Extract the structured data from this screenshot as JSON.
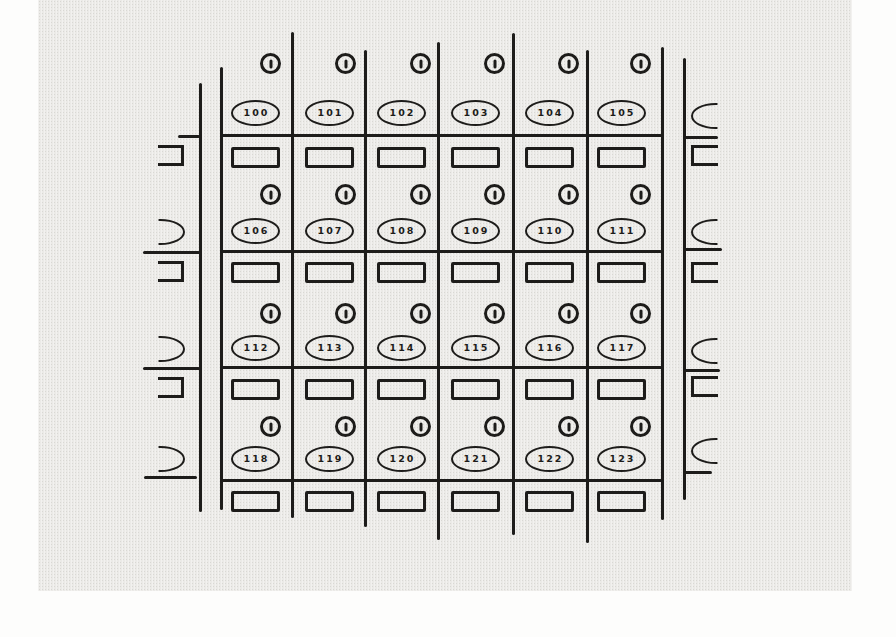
{
  "figure": {
    "kind": "lock-box-bank-line-drawing",
    "rows": [
      {
        "numbers": [
          "100",
          "101",
          "102",
          "103",
          "104",
          "105"
        ]
      },
      {
        "numbers": [
          "106",
          "107",
          "108",
          "109",
          "110",
          "111"
        ]
      },
      {
        "numbers": [
          "112",
          "113",
          "114",
          "115",
          "116",
          "117"
        ]
      },
      {
        "numbers": [
          "118",
          "119",
          "120",
          "121",
          "122",
          "123"
        ]
      }
    ],
    "colors": {
      "ink": "#1d1c1a",
      "paper": "#ebeae7",
      "page": "#fdfdfc"
    }
  }
}
